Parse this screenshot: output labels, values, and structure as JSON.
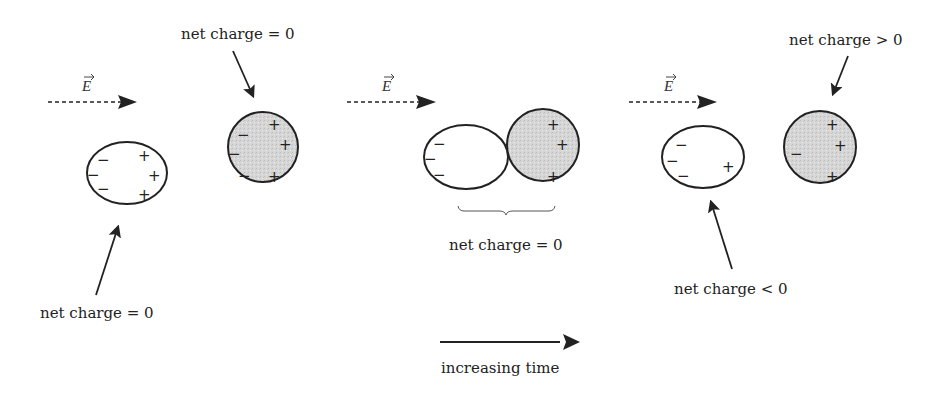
{
  "figure": {
    "panels": [
      {
        "id": "panel-1-separate",
        "field_label": "E",
        "objects": [
          {
            "name": "left-sphere",
            "shading": "light",
            "charges_left": [
              "−",
              "−",
              "−"
            ],
            "charges_right": [
              "+",
              "+",
              "+"
            ],
            "label": "net charge = 0"
          },
          {
            "name": "right-sphere",
            "shading": "gray",
            "charges_left": [
              "−",
              "−",
              "−"
            ],
            "charges_right": [
              "+",
              "+",
              "+"
            ],
            "label": "net charge = 0"
          }
        ]
      },
      {
        "id": "panel-2-touching",
        "field_label": "E",
        "objects": [
          {
            "name": "left-sphere",
            "shading": "light",
            "charges_left": [
              "−",
              "−",
              "−"
            ],
            "charges_right": []
          },
          {
            "name": "right-sphere",
            "shading": "gray",
            "charges_left": [],
            "charges_right": [
              "+",
              "+",
              "+"
            ]
          }
        ],
        "combined_label": "net charge = 0"
      },
      {
        "id": "panel-3-separated",
        "field_label": "E",
        "objects": [
          {
            "name": "left-sphere",
            "shading": "light",
            "charges_left": [
              "−",
              "−",
              "−"
            ],
            "charges_right": [
              "+"
            ],
            "label": "net charge < 0"
          },
          {
            "name": "right-sphere",
            "shading": "gray",
            "charges_left": [
              "−"
            ],
            "charges_right": [
              "+",
              "+",
              "+"
            ],
            "label": "net charge > 0"
          }
        ]
      }
    ],
    "time_arrow_label": "increasing time",
    "colors": {
      "ink": "#222222",
      "gray_fill": "#d9d9d9",
      "light_fill": "#ffffff"
    }
  }
}
